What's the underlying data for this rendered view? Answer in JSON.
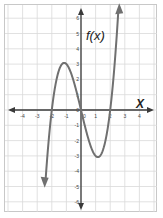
{
  "chart_data": {
    "type": "line",
    "title": "",
    "function_label": "f(x)",
    "xlabel": "x",
    "ylabel": "f(x)",
    "xlim": [
      -4.5,
      4.5
    ],
    "ylim": [
      -6.5,
      6.5
    ],
    "x_ticks": [
      -4,
      -3,
      -2,
      -1,
      0,
      1,
      2,
      3,
      4
    ],
    "y_ticks": [
      -6,
      -5,
      -4,
      -3,
      -2,
      -1,
      0,
      1,
      2,
      3,
      4,
      5,
      6
    ],
    "grid": true,
    "series": [
      {
        "name": "f(x) = x^3 - 4x",
        "x": [
          -2.45,
          -2.25,
          -2.0,
          -1.75,
          -1.5,
          -1.155,
          -1.0,
          -0.5,
          0.0,
          0.5,
          1.0,
          1.155,
          1.5,
          1.75,
          2.0,
          2.25,
          2.45,
          2.6
        ],
        "y": [
          -5.9,
          -2.39,
          0.0,
          1.64,
          2.63,
          3.08,
          3.0,
          1.88,
          0.0,
          -1.88,
          -3.0,
          -3.08,
          -2.63,
          -1.64,
          0.0,
          2.39,
          4.91,
          7.18
        ],
        "color": "#6e6e6e",
        "arrows": "both"
      }
    ],
    "key_points": {
      "roots": [
        -2,
        0,
        2
      ],
      "local_max": [
        -1.15,
        3.1
      ],
      "local_min": [
        1.15,
        -3.1
      ]
    }
  },
  "labels": {
    "fx": "f(x)",
    "x": "X"
  },
  "colors": {
    "curve": "#707070",
    "axis": "#3a3a3a",
    "grid": "#d9d9d9",
    "frame": "#c8c8c8"
  }
}
